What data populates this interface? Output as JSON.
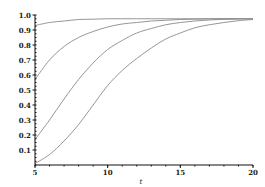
{
  "chart_data": {
    "type": "line",
    "title": "",
    "xlabel": "t",
    "ylabel": "",
    "xlim": [
      5,
      20
    ],
    "ylim": [
      0,
      1.0
    ],
    "grid": false,
    "legend": null,
    "x_ticks": [
      5,
      10,
      15,
      20
    ],
    "x_tick_labels": [
      "5",
      "10",
      "15",
      "20"
    ],
    "y_ticks": [
      0.1,
      0.2,
      0.3,
      0.4,
      0.5,
      0.6,
      0.7,
      0.8,
      0.9,
      1.0
    ],
    "y_tick_labels": [
      "0.1",
      "0.2",
      "0.3",
      "0.4",
      "0.5",
      "0.6",
      "0.7",
      "0.8",
      "0.9",
      "1.0"
    ],
    "x": [
      5,
      6,
      7,
      8,
      9,
      10,
      11,
      12,
      13,
      14,
      15,
      16,
      17,
      18,
      19,
      20
    ],
    "series": [
      {
        "name": "curve 1",
        "values": [
          0.93,
          0.95,
          0.96,
          0.97,
          0.972,
          0.975,
          0.975,
          0.975,
          0.975,
          0.975,
          0.975,
          0.975,
          0.975,
          0.975,
          0.975,
          0.975
        ]
      },
      {
        "name": "curve 2",
        "values": [
          0.57,
          0.7,
          0.79,
          0.85,
          0.89,
          0.92,
          0.94,
          0.95,
          0.96,
          0.965,
          0.97,
          0.972,
          0.974,
          0.975,
          0.975,
          0.975
        ]
      },
      {
        "name": "curve 3",
        "values": [
          0.17,
          0.3,
          0.44,
          0.57,
          0.68,
          0.77,
          0.83,
          0.88,
          0.91,
          0.935,
          0.95,
          0.96,
          0.967,
          0.971,
          0.973,
          0.975
        ]
      },
      {
        "name": "curve 4",
        "values": [
          0.01,
          0.07,
          0.16,
          0.27,
          0.4,
          0.53,
          0.63,
          0.71,
          0.78,
          0.84,
          0.88,
          0.915,
          0.935,
          0.95,
          0.962,
          0.97
        ]
      }
    ],
    "colors": {
      "curve": "#8a8a8a",
      "axis": "#111111"
    }
  }
}
